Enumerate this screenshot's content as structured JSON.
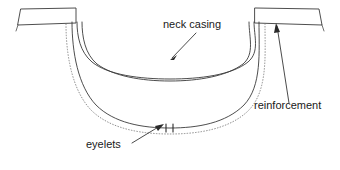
{
  "diagram": {
    "type": "technical-garment-illustration",
    "background_color": "#ffffff",
    "line_color": "#3a3a3a",
    "stitch_color": "#7a7a7a",
    "text_color": "#1a1a1a",
    "labels": [
      {
        "id": "neck-casing",
        "text": "neck casing",
        "x": 163,
        "y": 28,
        "anchor": "start",
        "leader": {
          "x1": 196,
          "y1": 33,
          "x2": 170,
          "y2": 60
        },
        "arrow_at": "end"
      },
      {
        "id": "reinforcement",
        "text": "reinforcement",
        "x": 254,
        "y": 109,
        "anchor": "start",
        "leader": {
          "x1": 289,
          "y1": 103,
          "x2": 277,
          "y2": 24
        },
        "arrow_at": "end"
      },
      {
        "id": "eyelets",
        "text": "eyelets",
        "x": 86,
        "y": 148,
        "anchor": "start",
        "leader": {
          "x1": 132,
          "y1": 143,
          "x2": 163,
          "y2": 124
        },
        "arrow_at": "end"
      }
    ],
    "parts": {
      "left_shoulder_band": "left shoulder reinforcement strip",
      "right_shoulder_band": "right shoulder reinforcement strip",
      "neck_casing": "double-line casing channel across neckline",
      "outer_edge": "outer neckline edge",
      "stitch_line": "dotted topstitch / seam line",
      "eyelets": "pair of eyelet tick marks at center bottom"
    },
    "eyelet_count": 2
  }
}
